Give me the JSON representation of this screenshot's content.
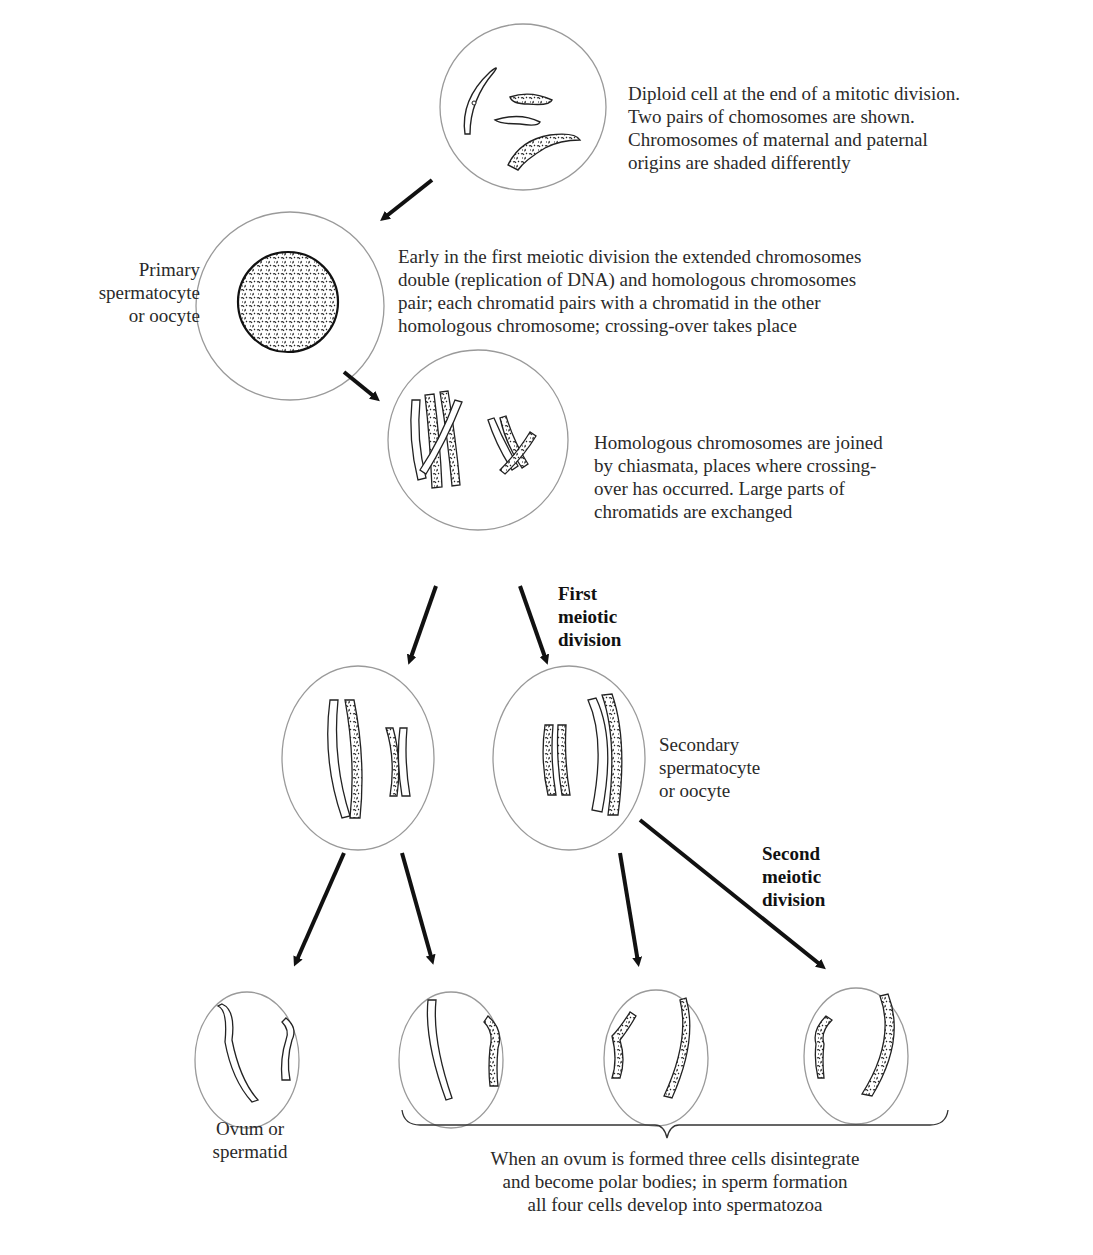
{
  "header_fragment": "y Biology",
  "captions": {
    "diploid": "Diploid cell at the end of a mitotic division.\nTwo pairs of chomosomes are shown.\nChromosomes of maternal and paternal\norigins are shaded differently",
    "primary_label": "Primary\nspermatocyte\nor oocyte",
    "early_meiosis": "Early in the first meiotic division the extended chromosomes\ndouble (replication of DNA) and homologous chromosomes\npair; each chromatid pairs with a chromatid in the other\nhomologous chromosome; crossing-over takes place",
    "chiasmata": "Homologous chromosomes are joined\nby chiasmata, places where crossing-\nover has occurred.  Large parts of\nchromatids are exchanged",
    "first_division": "First\nmeiotic\ndivision",
    "secondary_label": "Secondary\nspermatocyte\nor oocyte",
    "second_division": "Second\nmeiotic\ndivision",
    "ovum_label": "Ovum or\nspermatid",
    "polar_bodies": "When an ovum is formed three cells disintegrate\nand become polar bodies; in sperm formation\nall four cells develop into spermatozoa"
  },
  "cells": [
    {
      "id": "diploid-cell",
      "cx": 523,
      "cy": 107,
      "r": 83
    },
    {
      "id": "primary-cell",
      "cx": 290,
      "cy": 306,
      "r": 94
    },
    {
      "id": "chiasmata-cell",
      "cx": 478,
      "cy": 440,
      "r": 90
    },
    {
      "id": "secondary-cell-left",
      "cx": 358,
      "cy": 758,
      "r": 76,
      "ry": 92
    },
    {
      "id": "secondary-cell-right",
      "cx": 569,
      "cy": 758,
      "r": 76,
      "ry": 92
    },
    {
      "id": "gamete-1",
      "cx": 247,
      "cy": 1060,
      "r": 52,
      "ry": 68
    },
    {
      "id": "gamete-2",
      "cx": 451,
      "cy": 1060,
      "r": 52,
      "ry": 68
    },
    {
      "id": "gamete-3",
      "cx": 656,
      "cy": 1058,
      "r": 52,
      "ry": 68
    },
    {
      "id": "gamete-4",
      "cx": 856,
      "cy": 1056,
      "r": 52,
      "ry": 68
    }
  ]
}
